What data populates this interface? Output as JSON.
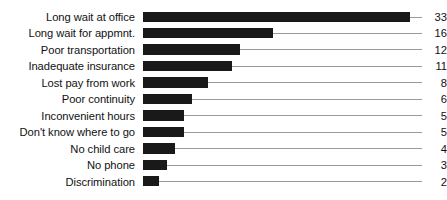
{
  "chart_data": {
    "type": "bar",
    "orientation": "horizontal",
    "title": "",
    "xlabel": "",
    "ylabel": "",
    "grid": false,
    "legend": null,
    "xlim": [
      0,
      33
    ],
    "value_labels_position": "right-of-leader-line",
    "categories": [
      "Long wait at office",
      "Long wait for appmnt.",
      "Poor transportation",
      "Inadequate insurance",
      "Lost pay from work",
      "Poor continuity",
      "Inconvenient hours",
      "Don't know where to go",
      "No child care",
      "No phone",
      "Discrimination"
    ],
    "values": [
      33,
      16,
      12,
      11,
      8,
      6,
      5,
      5,
      4,
      3,
      2
    ],
    "value_text": [
      "33",
      "16",
      "12",
      "11",
      "8",
      "6",
      "5",
      "5",
      "4",
      "3",
      "2"
    ],
    "colors": {
      "bar": "#191919",
      "leader_line": "#9a9a9a",
      "text": "#111111",
      "background": "#ffffff"
    }
  }
}
